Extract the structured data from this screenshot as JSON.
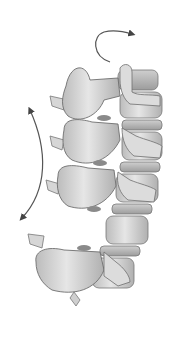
{
  "image": {
    "subject": "Illustration of vertebral column segment with rotation and flexion arrows",
    "background_color": "#ffffff",
    "bone_color": "#d9d9d9",
    "shade_color": "#a8a8a8",
    "outline_color": "#6e6e6e",
    "arrow_color": "#444444",
    "vertebrae_count": 4,
    "arrows": [
      {
        "name": "axial-rotation-arrow",
        "direction": "clockwise"
      },
      {
        "name": "flexion-extension-arrow",
        "direction": "bidirectional"
      }
    ]
  }
}
